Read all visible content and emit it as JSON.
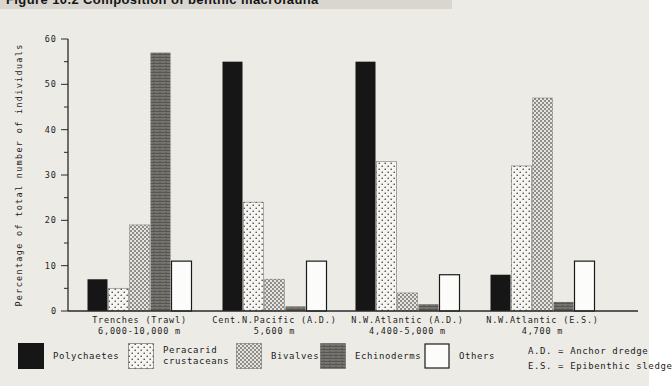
{
  "page": {
    "figure_title": "Figure 10.2   Composition of benthic macrofauna"
  },
  "chart_data": {
    "type": "bar",
    "title": "Figure 10.2  Composition of benthic macrofauna",
    "xlabel": "",
    "ylabel": "Percentage of total number of individuals",
    "ylim": [
      0,
      60
    ],
    "ytick_step": 10,
    "ytick_minor_step": 5,
    "grid": false,
    "legend_position": "bottom",
    "categories": [
      {
        "label": "Trenches (Trawl)",
        "sublabel": "6,000-10,000 m"
      },
      {
        "label": "Cent.N.Pacific (A.D.)",
        "sublabel": "5,600 m"
      },
      {
        "label": "N.W.Atlantic (A.D.)",
        "sublabel": "4,400-5,000 m"
      },
      {
        "label": "N.W.Atlantic (E.S.)",
        "sublabel": "4,700 m"
      }
    ],
    "series": [
      {
        "name": "Polychaetes",
        "pattern": "solid-black",
        "values": [
          7,
          55,
          55,
          8
        ]
      },
      {
        "name": "Peracarid crustaceans",
        "pattern": "light-dots",
        "values": [
          5,
          24,
          33,
          32
        ]
      },
      {
        "name": "Bivalves",
        "pattern": "gray-check",
        "values": [
          19,
          7,
          4,
          47
        ]
      },
      {
        "name": "Echinoderms",
        "pattern": "dark-gray",
        "values": [
          57,
          1,
          1.5,
          2
        ]
      },
      {
        "name": "Others",
        "pattern": "white",
        "values": [
          11,
          11,
          8,
          11
        ]
      }
    ],
    "notes": [
      "A.D. = Anchor dredge",
      "E.S. = Epibenthic sledge"
    ]
  },
  "legend": {
    "items": [
      {
        "label1": "Polychaetes",
        "label2": ""
      },
      {
        "label1": "Peracarid",
        "label2": "crustaceans"
      },
      {
        "label1": "Bivalves",
        "label2": ""
      },
      {
        "label1": "Echinoderms",
        "label2": ""
      },
      {
        "label1": "Others",
        "label2": ""
      }
    ],
    "note1": "A.D. = Anchor dredge",
    "note2": "E.S. = Epibenthic sledge"
  },
  "colors": {
    "page_background": "#edebe6",
    "title_band": "#d9d6d0",
    "bar_black": "#161616",
    "bar_dark_gray": "#757470",
    "bar_white": "#fcfcfa",
    "axis": "#2a2a2a",
    "text": "#1c1c1c"
  }
}
